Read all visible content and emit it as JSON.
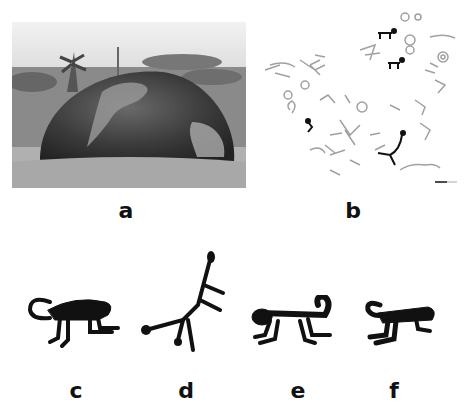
{
  "figure": {
    "panels": [
      {
        "id": "a",
        "label": "a",
        "description": "Photograph of a large domed granite boulder in a grassy field with palm trees in the background"
      },
      {
        "id": "b",
        "label": "b",
        "description": "Tracing of petroglyphs on the boulder surface, monkey figures highlighted in black, others in grey, with scale bar"
      },
      {
        "id": "c",
        "label": "c",
        "description": "Monkey petroglyph walking on four legs with curled tail"
      },
      {
        "id": "d",
        "label": "d",
        "description": "Monkey petroglyph in vertical stretched pose"
      },
      {
        "id": "e",
        "label": "e",
        "description": "Monkey petroglyph with tail curled upward"
      },
      {
        "id": "f",
        "label": "f",
        "description": "Monkey petroglyph with tail curled back"
      }
    ]
  },
  "colors": {
    "ink": "#111111",
    "trace_grey": "#9a9a9a",
    "background": "#ffffff"
  }
}
